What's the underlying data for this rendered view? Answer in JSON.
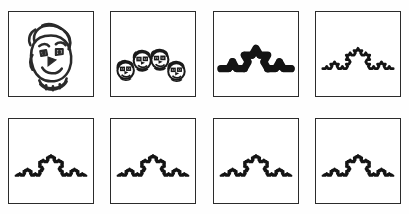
{
  "figure": {
    "title": "",
    "background_color": "#fefefe",
    "panel_border_color": "#2b2b2b",
    "ink_color": "#141414",
    "rows": 2,
    "columns": 4,
    "panel_count": 8
  },
  "panels": [
    {
      "index": 0,
      "iteration_label": "0",
      "content_kind": "seed-face",
      "description": "hand-drawn cartoon face with curly hair and collar",
      "copies": 1
    },
    {
      "index": 1,
      "iteration_label": "1",
      "content_kind": "face-copies",
      "description": "four shrunken face copies placed along the Koch generator",
      "copies": 4
    },
    {
      "index": 2,
      "iteration_label": "2",
      "content_kind": "face-copies",
      "description": "sixteen tiny face copies thickening into the Koch generator",
      "copies": 16
    },
    {
      "index": 3,
      "iteration_label": "3",
      "content_kind": "koch-curve",
      "description": "Koch curve outline, detail level 3",
      "depth": 3
    },
    {
      "index": 4,
      "iteration_label": "4",
      "content_kind": "koch-curve",
      "description": "Koch curve outline, detail level 4",
      "depth": 4
    },
    {
      "index": 5,
      "iteration_label": "5",
      "content_kind": "koch-curve",
      "description": "Koch curve outline, detail level 4",
      "depth": 4
    },
    {
      "index": 6,
      "iteration_label": "6",
      "content_kind": "koch-curve",
      "description": "Koch curve outline, detail level 4",
      "depth": 4
    },
    {
      "index": 7,
      "iteration_label": "7",
      "content_kind": "koch-curve",
      "description": "Koch curve attractor, detail level 4",
      "depth": 4
    }
  ],
  "chart_data": {
    "type": "line",
    "title": "",
    "xlabel": "",
    "ylabel": "",
    "koch": {
      "baseline_start": [
        7,
        58
      ],
      "baseline_end": [
        79,
        58
      ],
      "segment_angles_deg": [
        0,
        -60,
        60,
        0
      ],
      "curve_depths": [
        3,
        4,
        4,
        4,
        4
      ],
      "stroke_widths": {
        "depth3": 2.6,
        "depth4": 2.4
      }
    },
    "generator_face_positions": [
      {
        "cx": 15,
        "cy": 60,
        "r": 8.5
      },
      {
        "cx": 32,
        "cy": 50,
        "r": 9.0
      },
      {
        "cx": 50,
        "cy": 49,
        "r": 9.0
      },
      {
        "cx": 67,
        "cy": 61,
        "r": 8.5
      }
    ]
  }
}
